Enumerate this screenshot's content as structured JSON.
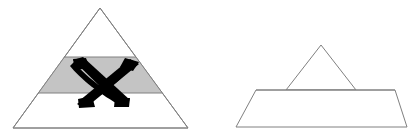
{
  "figure": {
    "type": "diagram",
    "background_color": "#ffffff",
    "canvas": {
      "width": 413,
      "height": 136
    },
    "stroke_color": "#808080",
    "stroke_width": 1,
    "band_fill_color": "#c4c4c4",
    "mark_color": "#000000",
    "white_fill_color": "#ffffff"
  },
  "left_figure": {
    "name": "full-pyramid-with-crossed-out-band",
    "label": "",
    "outline_points": "100,8 188,128 13,128",
    "apex": {
      "x": 100,
      "y": 8
    },
    "base_left": {
      "x": 13,
      "y": 128
    },
    "base_right": {
      "x": 188,
      "y": 128
    },
    "band": {
      "name": "middle-band",
      "fill": "#c4c4c4",
      "top_y": 57,
      "bottom_y": 93,
      "points": "64,57 136,57 162,93 38,93"
    },
    "cross_mark": {
      "name": "cross-out-x",
      "color": "#000000",
      "stroke1": "74,61 127,103",
      "stroke2": "128,62 78,104",
      "stroke_width": 15
    }
  },
  "right_figure": {
    "name": "reduced-pyramid",
    "label": "",
    "cap": {
      "name": "apex-triangle",
      "points": "321,45 356,90 286,90",
      "apex": {
        "x": 321,
        "y": 45
      },
      "base_left": {
        "x": 286,
        "y": 90
      },
      "base_right": {
        "x": 356,
        "y": 90
      }
    },
    "base": {
      "name": "base-trapezoid",
      "points": "256,90 395,90 407,127 236,127",
      "top_left": {
        "x": 256,
        "y": 90
      },
      "top_right": {
        "x": 395,
        "y": 90
      },
      "bottom_right": {
        "x": 407,
        "y": 127
      },
      "bottom_left": {
        "x": 236,
        "y": 127
      }
    }
  }
}
